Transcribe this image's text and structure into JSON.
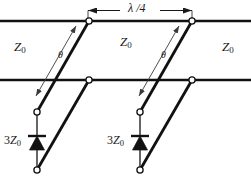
{
  "figure": {
    "background": "#ffffff",
    "line_color": "#111111",
    "thin_color": "#555555",
    "width": 251,
    "height": 185
  },
  "dimension": {
    "label": "λ /4",
    "arrow_y": 10,
    "x_start": 88,
    "x_end": 192
  },
  "impedance_labels": {
    "left": {
      "symbol": "Z",
      "sub": "0",
      "x": 14,
      "y": 40
    },
    "middle": {
      "symbol": "Z",
      "sub": "0",
      "x": 120,
      "y": 35
    },
    "right": {
      "symbol": "Z",
      "sub": "0",
      "x": 222,
      "y": 40
    }
  },
  "angle_labels": [
    {
      "text": "θ",
      "x": 62,
      "y": 53
    },
    {
      "text": "θ",
      "x": 165,
      "y": 53
    }
  ],
  "diode_labels": [
    {
      "prefix": "3",
      "symbol": "Z",
      "sub": "0",
      "x": 8,
      "y": 134
    },
    {
      "prefix": "3",
      "symbol": "Z",
      "sub": "0",
      "x": 111,
      "y": 134
    }
  ],
  "horizontal_lines": [
    {
      "name": "top-transmission-line",
      "y": 21,
      "x1": 0,
      "x2": 251
    },
    {
      "name": "second-transmission-line",
      "y": 80,
      "x1": 0,
      "x2": 251
    }
  ],
  "stub_units": [
    {
      "name": "stub-unit-left",
      "top_node": {
        "x": 89,
        "y": 21
      },
      "mid_node": {
        "x": 89,
        "y": 80
      },
      "upper_stub_node": {
        "x": 37,
        "y": 112
      },
      "lower_stub_node": {
        "x": 37,
        "y": 170
      },
      "diode": {
        "x": 37,
        "y": 141
      }
    },
    {
      "name": "stub-unit-right",
      "top_node": {
        "x": 192,
        "y": 21
      },
      "mid_node": {
        "x": 192,
        "y": 80
      },
      "upper_stub_node": {
        "x": 140,
        "y": 112
      },
      "lower_stub_node": {
        "x": 140,
        "y": 170
      },
      "diode": {
        "x": 140,
        "y": 141
      }
    }
  ]
}
